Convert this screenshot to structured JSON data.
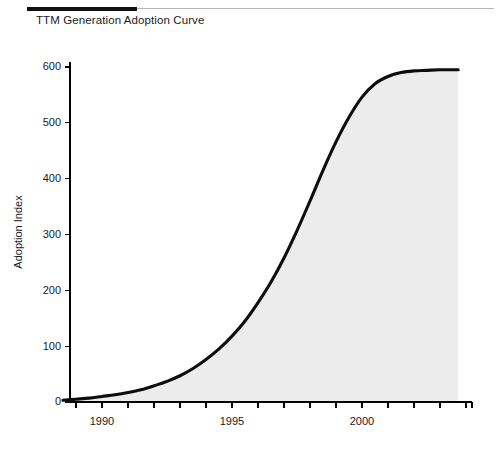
{
  "header": {
    "title": "TTM Generation Adoption Curve",
    "rule_color": "#111111",
    "hairline_color": "#b4b4b4"
  },
  "chart_data": {
    "type": "line",
    "title": "TTM Generation Adoption Curve",
    "subtitle": "",
    "xlabel": "",
    "ylabel": "Adoption Index",
    "xlim": [
      1988.5,
      1988.5
    ],
    "ylim": [
      0,
      620
    ],
    "grid": false,
    "legend": false,
    "legend_position": "none",
    "fill_under": true,
    "fill_color": "#ececec",
    "line_color": "#0d0d0d",
    "line_width": 3.1,
    "x_tick_labels": [
      "1990",
      "1995",
      "2000"
    ],
    "x_tick_label_values": [
      1990,
      1995,
      2000
    ],
    "x_minor_tick_count": 16,
    "y_tick_labels": [
      "0",
      "100",
      "200",
      "300",
      "400",
      "500",
      "600"
    ],
    "y_tick_values": [
      0,
      100,
      200,
      300,
      400,
      500,
      600
    ],
    "series": [
      {
        "name": "Adoption Index",
        "x": [
          1988.5,
          1989.0,
          1989.5,
          1990.0,
          1990.5,
          1991.0,
          1991.5,
          1992.0,
          1992.5,
          1993.0,
          1993.5,
          1994.0,
          1994.5,
          1995.0,
          1995.5,
          1996.0,
          1996.5,
          1997.0,
          1997.5,
          1998.0,
          1998.5,
          1999.0,
          1999.5,
          2000.0,
          2000.5,
          2001.0,
          2001.5,
          2002.0,
          2002.5,
          2003.0,
          2003.5,
          2003.7
        ],
        "y": [
          3,
          5,
          7,
          10,
          13,
          17,
          22,
          29,
          37,
          47,
          60,
          76,
          95,
          118,
          145,
          178,
          215,
          258,
          307,
          360,
          415,
          466,
          510,
          546,
          570,
          583,
          590,
          593,
          594,
          595,
          595,
          595
        ]
      }
    ],
    "annotations": []
  }
}
